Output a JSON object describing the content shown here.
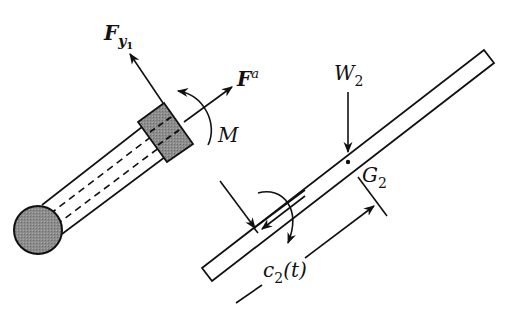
{
  "figure": {
    "labels": {
      "force_y1": {
        "main": "F",
        "sub": "y",
        "subsub": "1"
      },
      "force_a": {
        "main": "F",
        "sup": "a"
      },
      "moment": "M",
      "weight": {
        "main": "W",
        "sub": "2"
      },
      "center_of_gravity": {
        "main": "G",
        "sub": "2"
      },
      "distance": {
        "main": "c",
        "sub": "2",
        "arg": "(t)"
      }
    },
    "colors": {
      "ink": "#111111",
      "shaded_fill": "#8c8c8c",
      "background": "#ffffff"
    },
    "components": [
      "sphere",
      "telescoping-arm",
      "collar",
      "sliding-bar"
    ]
  }
}
